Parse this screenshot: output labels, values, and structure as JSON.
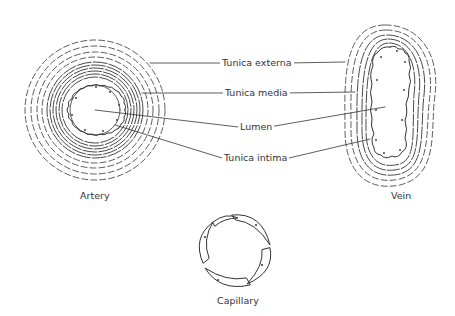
{
  "diagram": {
    "vessels": [
      {
        "id": "artery",
        "label": "Artery"
      },
      {
        "id": "vein",
        "label": "Vein"
      },
      {
        "id": "capillary",
        "label": "Capillary"
      }
    ],
    "callouts": [
      {
        "id": "tunica-externa",
        "label": "Tunica externa"
      },
      {
        "id": "tunica-media",
        "label": "Tunica media"
      },
      {
        "id": "lumen",
        "label": "Lumen"
      },
      {
        "id": "tunica-intima",
        "label": "Tunica intima"
      }
    ],
    "colors": {
      "line": "#333333",
      "background": "#ffffff"
    }
  }
}
